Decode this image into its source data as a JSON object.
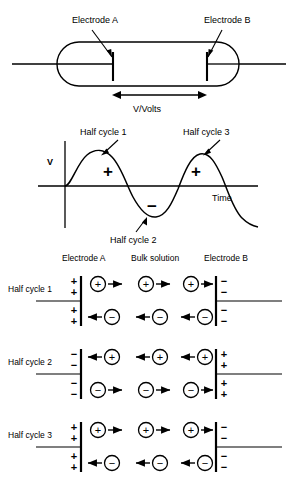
{
  "figure": {
    "cell_diagram": {
      "electrode_a_label": "Electrode A",
      "electrode_b_label": "Electrode B",
      "voltage_label": "V/Volts"
    },
    "waveform": {
      "y_axis_label": "V",
      "x_axis_label": "Time",
      "positive_sign": "+",
      "negative_sign": "−",
      "annotations": [
        "Half cycle 1",
        "Half cycle 2",
        "Half cycle 3"
      ]
    },
    "migration": {
      "columns": [
        "Electrode A",
        "Bulk solution",
        "Electrode B"
      ],
      "rows": [
        {
          "label": "Half cycle 1",
          "electrode_a_charge": "+",
          "electrode_b_charge": "−",
          "cation_direction": "right",
          "anion_direction": "left",
          "cation_symbol": "+",
          "anion_symbol": "−"
        },
        {
          "label": "Half cycle 2",
          "electrode_a_charge": "−",
          "electrode_b_charge": "+",
          "cation_direction": "left",
          "anion_direction": "right",
          "cation_symbol": "+",
          "anion_symbol": "−"
        },
        {
          "label": "Half cycle 3",
          "electrode_a_charge": "+",
          "electrode_b_charge": "−",
          "cation_direction": "right",
          "anion_direction": "left",
          "cation_symbol": "+",
          "anion_symbol": "−"
        }
      ]
    },
    "colors": {
      "line": "#000000",
      "background": "#ffffff"
    }
  }
}
